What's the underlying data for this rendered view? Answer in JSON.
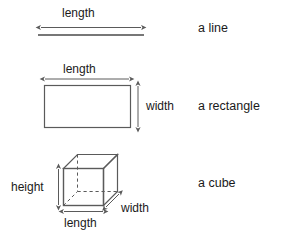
{
  "figure": {
    "title": "",
    "background_color": "#ffffff",
    "stroke_color": "#5a5a5a",
    "text_color": "#1a1a1a",
    "rows": [
      {
        "shape": "line",
        "caption": "a line",
        "dimension_labels": [
          "length"
        ],
        "measures": {
          "length": "length"
        }
      },
      {
        "shape": "rectangle",
        "caption": "a rectangle",
        "dimension_labels": [
          "length",
          "width"
        ],
        "measures": {
          "length": "length",
          "width": "width"
        }
      },
      {
        "shape": "cube",
        "caption": "a cube",
        "dimension_labels": [
          "height",
          "length",
          "width"
        ],
        "measures": {
          "height": "height",
          "length": "length",
          "width": "width"
        }
      }
    ]
  },
  "labels": {
    "line_length": "length",
    "rect_length": "length",
    "rect_width": "width",
    "cube_height": "height",
    "cube_length": "length",
    "cube_width": "width"
  },
  "captions": {
    "line": "a line",
    "rectangle": "a rectangle",
    "cube": "a cube"
  }
}
